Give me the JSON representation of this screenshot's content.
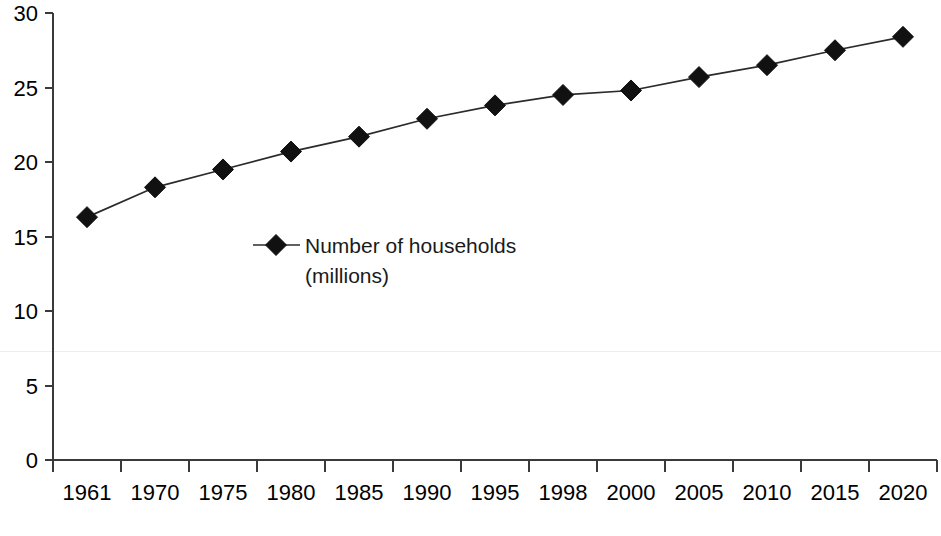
{
  "chart_data": {
    "type": "line",
    "title": "",
    "subtitle": "",
    "xlabel": "",
    "ylabel": "",
    "categories": [
      "1961",
      "1970",
      "1975",
      "1980",
      "1985",
      "1990",
      "1995",
      "1998",
      "2000",
      "2005",
      "2010",
      "2015",
      "2020"
    ],
    "values": [
      16.3,
      18.3,
      19.5,
      20.7,
      21.7,
      22.9,
      23.8,
      24.5,
      24.8,
      25.7,
      26.5,
      27.5,
      28.4
    ],
    "series": [
      {
        "name": "Number of households (millions)",
        "values": [
          16.3,
          18.3,
          19.5,
          20.7,
          21.7,
          22.9,
          23.8,
          24.5,
          24.8,
          25.7,
          26.5,
          27.5,
          28.4
        ],
        "marker": "diamond",
        "color": "#111111"
      }
    ],
    "ylim": [
      0,
      30
    ],
    "y_ticks": [
      0,
      5,
      10,
      15,
      20,
      25,
      30
    ],
    "y_tick_labels": [
      "0",
      "5",
      "10",
      "15",
      "20",
      "25",
      "30"
    ],
    "x_tick_labels": [
      "1961",
      "1970",
      "1975",
      "1980",
      "1985",
      "1990",
      "1995",
      "1998",
      "2000",
      "2005",
      "2010",
      "2015",
      "2020"
    ],
    "grid": false,
    "legend_position": "inside-center-left",
    "legend": [
      {
        "label_line1": "Number of households",
        "label_line2": "(millions)",
        "marker": "diamond",
        "color": "#111111"
      }
    ]
  },
  "legend": {
    "line1": "Number of households",
    "line2": "(millions)"
  },
  "colors": {
    "series": "#111111",
    "axis": "#3a3a3a",
    "text": "#000000",
    "background": "#ffffff"
  }
}
